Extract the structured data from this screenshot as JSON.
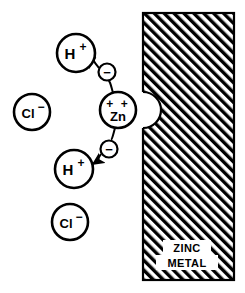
{
  "figure": {
    "background_color": "#ffffff",
    "line_color": "#000000",
    "width": 245,
    "height": 293
  },
  "metal_block": {
    "label_line1": "ZINC",
    "label_line2": "METAL",
    "hatch_pattern": "diagonal-45",
    "hatch_color": "#000000",
    "fill_color": "#ffffff",
    "border_color": "#000000",
    "notch": "semicircular-pit-at-left-edge"
  },
  "particles": [
    {
      "id": "h-plus-upper",
      "symbol": "H",
      "charge": "+",
      "kind": "hydrogen-ion",
      "cx": 76,
      "cy": 53,
      "r": 19
    },
    {
      "id": "electron-upper",
      "symbol": "−",
      "charge": "−",
      "kind": "electron",
      "cx": 107,
      "cy": 72,
      "r": 9
    },
    {
      "id": "zinc-ion",
      "symbol": "Zn",
      "charge": "+ +",
      "kind": "zinc-ion",
      "cx": 118,
      "cy": 110,
      "r": 18
    },
    {
      "id": "electron-lower",
      "symbol": "−",
      "charge": "−",
      "kind": "electron",
      "cx": 109,
      "cy": 149,
      "r": 9
    },
    {
      "id": "h-plus-lower",
      "symbol": "H",
      "charge": "+",
      "kind": "hydrogen-ion",
      "cx": 74,
      "cy": 169,
      "r": 19
    },
    {
      "id": "chloride-upper",
      "symbol": "Cl",
      "charge": "−",
      "kind": "chloride-ion",
      "cx": 32,
      "cy": 112,
      "r": 18
    },
    {
      "id": "chloride-lower",
      "symbol": "Cl",
      "charge": "−",
      "kind": "chloride-ion",
      "cx": 70,
      "cy": 222,
      "r": 18
    }
  ],
  "arrows": [
    {
      "id": "electron-to-h-upper",
      "from": "electron-upper",
      "to": "h-plus-upper",
      "style": "curved-with-arrowhead"
    },
    {
      "id": "electron-to-h-lower",
      "from": "electron-lower",
      "to": "h-plus-lower",
      "style": "curved-with-arrowhead"
    }
  ],
  "text": {
    "h_symbol": "H",
    "h_charge": "+",
    "cl_symbol": "Cl",
    "cl_charge": "−",
    "zn_symbol": "Zn",
    "zn_charge": "+ +",
    "electron_symbol": "−",
    "zinc_metal_line1": "ZINC",
    "zinc_metal_line2": "METAL"
  }
}
